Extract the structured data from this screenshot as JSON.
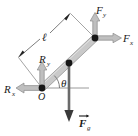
{
  "figure": {
    "background_color": "#ffffff",
    "width": 138,
    "height": 136
  },
  "colors": {
    "rod_fill": "#c9c9c9",
    "rod_edge": "#8a8a8a",
    "arrow_light": "#bdbdbd",
    "arrow_light_edge": "#7a7a7a",
    "arrow_dark": "#555555",
    "axis_line": "#9a9a9a",
    "node_dot": "#161616",
    "dimension_line": "#6e6e6e",
    "text": "#1a1a1a"
  },
  "labels": {
    "origin": {
      "text": "O",
      "x": 39,
      "y": 99
    },
    "length": {
      "text": "ℓ",
      "x": 44,
      "y": 40
    },
    "angle": {
      "text": "θ",
      "x": 61,
      "y": 87
    },
    "reaction_x": {
      "base": "R",
      "sub": "x",
      "base_x": 5,
      "base_y": 93,
      "sub_x": 14,
      "sub_y": 96
    },
    "reaction_y": {
      "base": "R",
      "sub": "y",
      "base_x": 40,
      "base_y": 63,
      "sub_x": 49,
      "sub_y": 66
    },
    "force_x": {
      "base": "F",
      "sub": "x",
      "base_x": 123,
      "base_y": 42,
      "sub_x": 131,
      "sub_y": 45
    },
    "force_y": {
      "base": "F",
      "sub": "y",
      "base_x": 96,
      "base_y": 14,
      "sub_x": 104,
      "sub_y": 17
    },
    "force_gravity": {
      "base": "F",
      "sub": "g",
      "base_x": 80,
      "base_y": 126,
      "sub_x": 89,
      "sub_y": 129,
      "has_vector_arrow": true
    }
  },
  "geometry": {
    "origin_point": {
      "x": 42,
      "y": 88
    },
    "rod_top_point": {
      "x": 95,
      "y": 38
    },
    "rod_mid_point": {
      "x": 69,
      "y": 63
    },
    "rod_half_width": 3.2,
    "dimension_line": {
      "x1": 18,
      "y1": 57,
      "x2": 70,
      "y2": 13
    },
    "dimension_tick_lower": {
      "x1": 18,
      "y1": 57,
      "x2": 42,
      "y2": 88
    },
    "dimension_tick_upper": {
      "x1": 70,
      "y1": 13,
      "x2": 95,
      "y2": 38
    },
    "horizontal_axis": {
      "x1": 42,
      "y1": 88,
      "x2": 88,
      "y2": 88
    },
    "axis_from_top_node": {
      "x1": 95,
      "y1": 38,
      "x2": 95,
      "y2": 18
    },
    "gravity_arrow": {
      "x1": 69,
      "y1": 63,
      "x2": 69,
      "y2": 122
    }
  },
  "vectors": [
    {
      "name": "reaction-x",
      "symbol": "Rx",
      "direction": "left",
      "style": "light",
      "from": {
        "x": 42,
        "y": 88
      },
      "to": {
        "x": 16,
        "y": 88
      }
    },
    {
      "name": "reaction-y",
      "symbol": "Ry",
      "direction": "up",
      "style": "light",
      "from": {
        "x": 42,
        "y": 88
      },
      "to": {
        "x": 42,
        "y": 62
      }
    },
    {
      "name": "force-x",
      "symbol": "Fx",
      "direction": "right",
      "style": "light",
      "from": {
        "x": 95,
        "y": 38
      },
      "to": {
        "x": 122,
        "y": 38
      }
    },
    {
      "name": "force-y",
      "symbol": "Fy",
      "direction": "up",
      "style": "light",
      "from": {
        "x": 95,
        "y": 38
      },
      "to": {
        "x": 95,
        "y": 13
      }
    },
    {
      "name": "force-gravity",
      "symbol": "Fg",
      "direction": "down",
      "style": "dark",
      "from": {
        "x": 69,
        "y": 63
      },
      "to": {
        "x": 69,
        "y": 122
      }
    }
  ]
}
